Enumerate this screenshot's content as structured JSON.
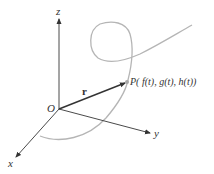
{
  "diagram": {
    "labels": {
      "z_axis": "z",
      "y_axis": "y",
      "x_axis": "x",
      "origin": "O",
      "vector": "r",
      "point": "P( f(t), g(t), h(t))"
    },
    "colors": {
      "axis": "#4a4a4a",
      "curve": "#b0b0b0",
      "vector": "#333333",
      "point": "#a8a8a8",
      "text": "#333333"
    },
    "points": {
      "origin": [
        59,
        109
      ],
      "z_end": [
        59,
        18
      ],
      "y_end": [
        150,
        133
      ],
      "x_end": [
        15,
        158
      ],
      "P": [
        127,
        82
      ]
    }
  }
}
